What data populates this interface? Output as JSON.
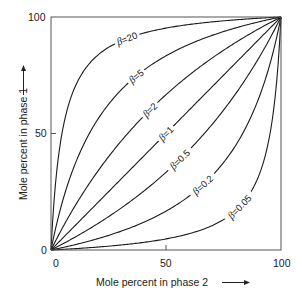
{
  "chart_data": {
    "type": "line",
    "title": "",
    "xlabel": "Mole percent in phase 2",
    "ylabel": "Mole percent in phase 1",
    "xlim": [
      0,
      100
    ],
    "ylim": [
      0,
      100
    ],
    "grid": false,
    "legend": "none (curves labeled inline)",
    "x_ticks": [
      "0",
      "50",
      "100"
    ],
    "y_ticks": [
      "0",
      "50",
      "100"
    ],
    "formula": "y = beta*x / (1 + (beta-1)*x/100)",
    "x": [
      0,
      10,
      20,
      30,
      40,
      50,
      60,
      70,
      80,
      90,
      100
    ],
    "series": [
      {
        "name": "β=20",
        "beta": 20,
        "label": "=20",
        "values": [
          0,
          69.0,
          83.3,
          89.6,
          93.0,
          95.2,
          96.8,
          97.9,
          98.8,
          99.4,
          100
        ]
      },
      {
        "name": "β=5",
        "beta": 5,
        "label": "=5",
        "values": [
          0,
          35.7,
          55.6,
          68.2,
          76.9,
          83.3,
          88.2,
          92.1,
          95.2,
          97.8,
          100
        ]
      },
      {
        "name": "β=2",
        "beta": 2,
        "label": "=2",
        "values": [
          0,
          18.2,
          33.3,
          46.2,
          57.1,
          66.7,
          75.0,
          82.4,
          88.9,
          94.7,
          100
        ]
      },
      {
        "name": "β=1",
        "beta": 1,
        "label": "=1",
        "values": [
          0,
          10,
          20,
          30,
          40,
          50,
          60,
          70,
          80,
          90,
          100
        ]
      },
      {
        "name": "β=0.5",
        "beta": 0.5,
        "label": "=0.5",
        "values": [
          0,
          5.3,
          11.1,
          17.6,
          25.0,
          33.3,
          42.9,
          53.8,
          66.7,
          81.8,
          100
        ]
      },
      {
        "name": "β=0.2",
        "beta": 0.2,
        "label": "=0.2",
        "values": [
          0,
          2.2,
          4.8,
          7.9,
          11.8,
          16.7,
          23.1,
          31.8,
          44.4,
          64.3,
          100
        ]
      },
      {
        "name": "β=0.05",
        "beta": 0.05,
        "label": "=0.05",
        "values": [
          0,
          0.6,
          1.2,
          2.1,
          3.2,
          4.8,
          7.0,
          10.4,
          16.7,
          31.0,
          100
        ]
      }
    ],
    "annotations": [
      {
        "text": "β=20",
        "x": 33,
        "y": 78
      },
      {
        "text": "β=5",
        "x": 37,
        "y": 63
      },
      {
        "text": "β=2",
        "x": 43,
        "y": 57
      },
      {
        "text": "β=1",
        "x": 50,
        "y": 50
      },
      {
        "text": "β=0.5",
        "x": 56,
        "y": 43
      },
      {
        "text": "β=0.2",
        "x": 66,
        "y": 35
      },
      {
        "text": "β=0.05",
        "x": 82,
        "y": 28
      }
    ],
    "axis_arrows": {
      "x": "→ after x-axis title",
      "y": "↑ after y-axis title"
    }
  },
  "colors": {
    "line": "#1a1a1a",
    "frame": "#444444",
    "background": "#ffffff"
  }
}
